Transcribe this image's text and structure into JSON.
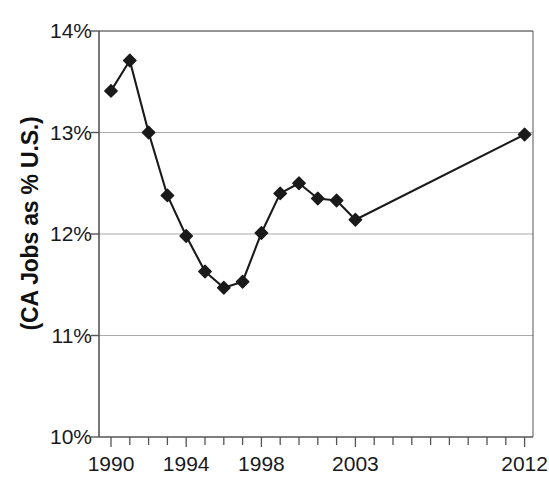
{
  "chart_data": {
    "type": "line",
    "title": "",
    "subtitle": "",
    "xlabel": "",
    "ylabel": "(CA Jobs as % U.S.)",
    "x": [
      1990,
      1991,
      1992,
      1993,
      1994,
      1995,
      1996,
      1997,
      1998,
      1999,
      2000,
      2001,
      2002,
      2003,
      2012
    ],
    "values": [
      13.41,
      13.71,
      13.0,
      12.38,
      11.98,
      11.63,
      11.47,
      11.53,
      12.01,
      12.4,
      12.5,
      12.35,
      12.33,
      12.14,
      12.98
    ],
    "series": [
      {
        "name": "CA Jobs as % U.S.",
        "values": [
          13.41,
          13.71,
          13.0,
          12.38,
          11.98,
          11.63,
          11.47,
          11.53,
          12.01,
          12.4,
          12.5,
          12.35,
          12.33,
          12.14,
          12.98
        ]
      }
    ],
    "xlim": [
      1990,
      2012
    ],
    "ylim": [
      10,
      14
    ],
    "y_ticks": [
      10,
      11,
      12,
      13,
      14
    ],
    "y_tick_labels": [
      "10%",
      "11%",
      "12%",
      "13%",
      "14%"
    ],
    "x_ticks": [
      1990,
      1994,
      1998,
      2003,
      2012
    ],
    "x_tick_labels": [
      "1990",
      "1994",
      "1998",
      "2003",
      "2012"
    ],
    "x_minor_ticks": [
      1990,
      1991,
      1992,
      1993,
      1994,
      1995,
      1996,
      1997,
      1998,
      1999,
      2000,
      2001,
      2002,
      2003,
      2004,
      2005,
      2006,
      2007,
      2008,
      2009,
      2010,
      2011,
      2012
    ],
    "grid": "horizontal",
    "legend": "none",
    "marker": "diamond",
    "line_color": "#1a1a1a",
    "marker_color": "#1a1a1a",
    "grid_color": "#aaaaaa",
    "axis_color": "#555555",
    "background_color": "#ffffff"
  },
  "geometry": {
    "plot_left": 99,
    "plot_right": 533,
    "plot_top": 31,
    "plot_bottom": 437
  }
}
